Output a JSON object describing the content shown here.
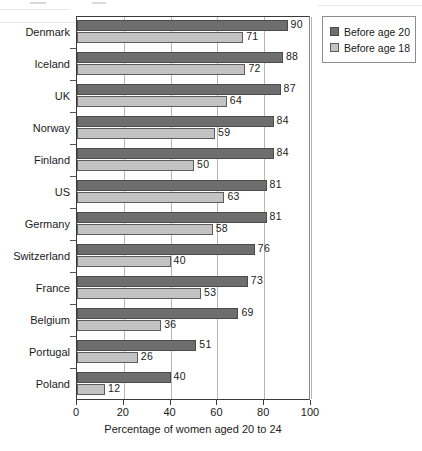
{
  "chart_data": {
    "type": "bar",
    "orientation": "horizontal",
    "title": "",
    "xlabel": "Percentage of women aged 20 to 24",
    "ylabel": "",
    "xlim": [
      0,
      100
    ],
    "xticks": [
      0,
      20,
      40,
      60,
      80,
      100
    ],
    "grid": "vertical",
    "legend_position": "top-right",
    "categories": [
      "Denmark",
      "Iceland",
      "UK",
      "Norway",
      "Finland",
      "US",
      "Germany",
      "Switzerland",
      "France",
      "Belgium",
      "Portugal",
      "Poland"
    ],
    "series": [
      {
        "name": "Before age 20",
        "color": "#6e6e6e",
        "values": [
          90,
          88,
          87,
          84,
          84,
          81,
          81,
          76,
          73,
          69,
          51,
          40
        ]
      },
      {
        "name": "Before age 18",
        "color": "#c3c3c3",
        "values": [
          71,
          72,
          64,
          59,
          50,
          63,
          58,
          40,
          53,
          36,
          26,
          12
        ]
      }
    ]
  },
  "legend": {
    "items": [
      {
        "label": "Before age 20",
        "swatch": "series-0-swatch"
      },
      {
        "label": "Before age 18",
        "swatch": "series-1-swatch"
      }
    ]
  },
  "axis": {
    "x_title": "Percentage of women aged 20 to 24",
    "x_tick_labels": [
      "0",
      "20",
      "40",
      "60",
      "80",
      "100"
    ]
  }
}
